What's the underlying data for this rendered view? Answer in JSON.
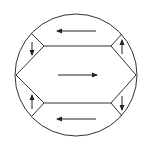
{
  "diagram": {
    "stroke_color": "#333333",
    "background": "#ffffff",
    "circle": {
      "cx": 76,
      "cy": 75,
      "r": 61
    },
    "regions": [
      {
        "name": "top-segment",
        "arrow_direction": "left"
      },
      {
        "name": "center-hexagon",
        "arrow_direction": "right"
      },
      {
        "name": "bottom-segment",
        "arrow_direction": "left"
      },
      {
        "name": "top-left-corner",
        "arrow_direction": "down"
      },
      {
        "name": "top-right-corner",
        "arrow_direction": "up"
      },
      {
        "name": "bottom-left-corner",
        "arrow_direction": "up"
      },
      {
        "name": "bottom-right-corner",
        "arrow_direction": "down"
      }
    ]
  }
}
